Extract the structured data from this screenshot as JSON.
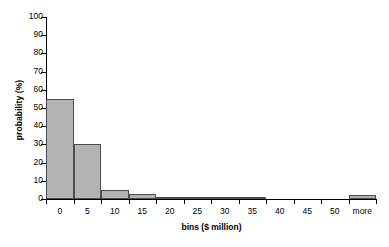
{
  "chart_data": {
    "type": "bar",
    "title": "",
    "xlabel": "bins ($ million)",
    "ylabel": "probability (%)",
    "categories": [
      "0",
      "5",
      "10",
      "15",
      "20",
      "25",
      "30",
      "35",
      "40",
      "45",
      "50",
      "more"
    ],
    "values": [
      55,
      30,
      5,
      2.5,
      1,
      0.6,
      0.4,
      0.3,
      0,
      0,
      0,
      2
    ],
    "ylim": [
      0,
      100
    ],
    "yticks": [
      0,
      10,
      20,
      30,
      40,
      50,
      60,
      70,
      80,
      90,
      100
    ],
    "ytick_labels": [
      "0",
      "10",
      "20",
      "30",
      "40",
      "50",
      "60",
      "70",
      "80",
      "90",
      "100"
    ],
    "grid": false,
    "legend": "none",
    "bar_fill_color": "#b3b3b3",
    "bar_edge_color": "#4d4d4d",
    "axis_color": "#000000"
  }
}
